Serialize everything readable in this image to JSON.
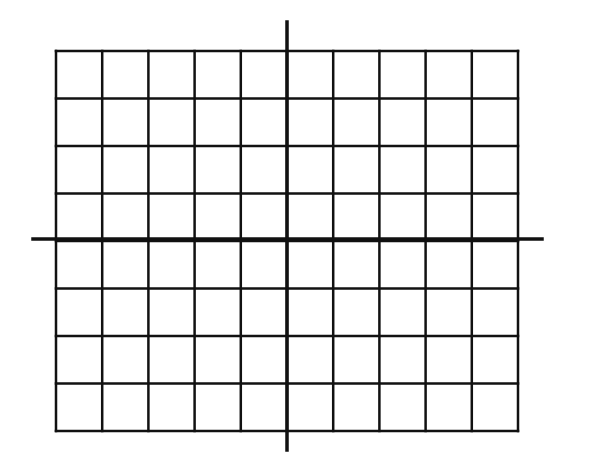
{
  "diagram": {
    "type": "coordinate-grid",
    "columns": 10,
    "rows": 8,
    "grid": {
      "left": 56,
      "top": 51,
      "right": 518,
      "bottom": 431
    },
    "x_axis": {
      "y": 239,
      "x1": 33,
      "x2": 542
    },
    "y_axis": {
      "x": 287,
      "y1": 22,
      "y2": 450
    },
    "line_color": "#111111",
    "background": "#ffffff"
  }
}
